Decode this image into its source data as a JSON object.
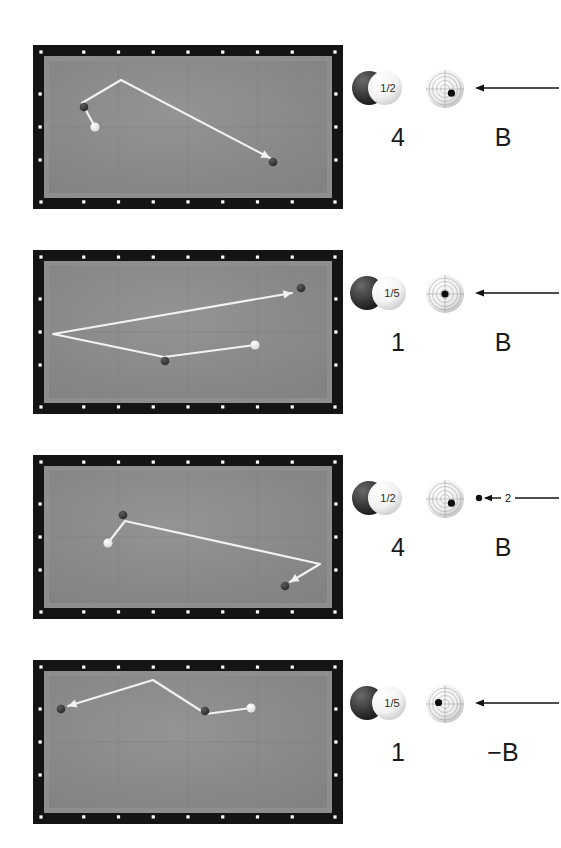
{
  "page": {
    "type": "billiards-shot-diagram-sheet",
    "background": "#ffffff",
    "table_count": 4
  },
  "colors": {
    "rail": "#141414",
    "cushion": "#8e8e8e",
    "cloth": "#8a8a8a",
    "grid": "#7e7e7e",
    "path": "#f2f2f2",
    "object_ball": "#3a3a3a",
    "cue_ball": "#f5f5f5",
    "diamond": "#ffffff",
    "text": "#1a1a1a"
  },
  "table_geometry": {
    "width": 310,
    "height": 164,
    "rail_thickness": 12,
    "play_left": 16,
    "play_top": 16,
    "play_width": 278,
    "play_height": 132,
    "diamonds_long": 8,
    "diamonds_short": 4,
    "grid_cols": 4,
    "grid_rows": 2
  },
  "rows": [
    {
      "id": "row-1",
      "top": 45,
      "shot": {
        "cue_ball": {
          "x": 62,
          "y": 82
        },
        "balls": [
          {
            "name": "object-ball-1",
            "x": 51,
            "y": 62
          },
          {
            "name": "object-ball-2",
            "x": 240,
            "y": 117
          }
        ],
        "path": [
          [
            62,
            82
          ],
          [
            49,
            58
          ],
          [
            88,
            35
          ],
          [
            237,
            113
          ]
        ],
        "arrow_at_end": true
      },
      "spec": {
        "hit_fraction": "1/2",
        "left_label": "4",
        "right_label": "B",
        "tip_contact": {
          "dx": 0.34,
          "dy": 0.22
        },
        "arrow": {
          "label": "",
          "has_dot": false,
          "length": 84
        },
        "ball_overlap": "half"
      }
    },
    {
      "id": "row-2",
      "top": 250,
      "shot": {
        "cue_ball": {
          "x": 222,
          "y": 95
        },
        "balls": [
          {
            "name": "object-ball-1",
            "x": 132,
            "y": 111
          },
          {
            "name": "object-ball-2",
            "x": 268,
            "y": 38
          }
        ],
        "path": [
          [
            222,
            95
          ],
          [
            131,
            107
          ],
          [
            20,
            84
          ],
          [
            259,
            43
          ]
        ],
        "arrow_at_end": true
      },
      "spec": {
        "hit_fraction": "1/5",
        "left_label": "1",
        "right_label": "B",
        "tip_contact": {
          "dx": 0.0,
          "dy": 0.0
        },
        "arrow": {
          "label": "",
          "has_dot": false,
          "length": 84
        },
        "ball_overlap": "fifth"
      }
    },
    {
      "id": "row-3",
      "top": 455,
      "shot": {
        "cue_ball": {
          "x": 75,
          "y": 88
        },
        "balls": [
          {
            "name": "object-ball-1",
            "x": 90,
            "y": 60
          },
          {
            "name": "object-ball-2",
            "x": 252,
            "y": 131
          }
        ],
        "path": [
          [
            75,
            88
          ],
          [
            92,
            66
          ],
          [
            287,
            109
          ],
          [
            257,
            127
          ]
        ],
        "arrow_at_end": true
      },
      "spec": {
        "hit_fraction": "1/2",
        "left_label": "4",
        "right_label": "B",
        "tip_contact": {
          "dx": 0.34,
          "dy": 0.22
        },
        "arrow": {
          "label": "2",
          "has_dot": true,
          "length": 84
        },
        "ball_overlap": "half"
      }
    },
    {
      "id": "row-4",
      "top": 660,
      "shot": {
        "cue_ball": {
          "x": 218,
          "y": 48
        },
        "balls": [
          {
            "name": "object-ball-1",
            "x": 172,
            "y": 51
          },
          {
            "name": "object-ball-2",
            "x": 28,
            "y": 49
          }
        ],
        "path": [
          [
            218,
            48
          ],
          [
            173,
            54
          ],
          [
            120,
            20
          ],
          [
            35,
            46
          ]
        ],
        "arrow_at_end": true
      },
      "spec": {
        "hit_fraction": "1/5",
        "left_label": "1",
        "right_label": "−B",
        "tip_contact": {
          "dx": -0.34,
          "dy": -0.08
        },
        "arrow": {
          "label": "",
          "has_dot": false,
          "length": 84
        },
        "ball_overlap": "fifth"
      }
    }
  ]
}
